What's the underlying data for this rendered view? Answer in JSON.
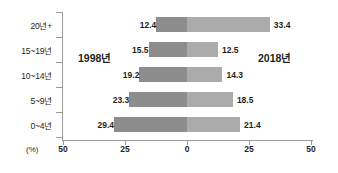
{
  "chart_data": {
    "type": "bar",
    "subtype": "diverging-horizontal-bar",
    "title": "",
    "xlabel": "(%)",
    "ylabel": "",
    "categories": [
      "20년+",
      "15~19년",
      "10~14년",
      "5~9년",
      "0~4년"
    ],
    "series": [
      {
        "name": "1998년",
        "side": "left",
        "color": "#8d8d8d",
        "values": [
          12.4,
          15.5,
          19.2,
          23.3,
          29.4
        ]
      },
      {
        "name": "2018년",
        "side": "right",
        "color": "#ababab",
        "values": [
          33.4,
          12.5,
          14.3,
          18.5,
          21.4
        ]
      }
    ],
    "xlim": [
      -50,
      50
    ],
    "x_ticks": [
      {
        "value": -50,
        "label": "50"
      },
      {
        "value": -25,
        "label": "25"
      },
      {
        "value": 0,
        "label": "0"
      },
      {
        "value": 25,
        "label": "25"
      },
      {
        "value": 50,
        "label": "50"
      }
    ],
    "grid": false,
    "legend_position": "inline",
    "unit": "(%)",
    "axis_color": "#9a9a9a"
  }
}
